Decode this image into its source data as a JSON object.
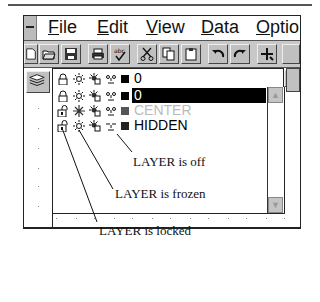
{
  "menu": {
    "items": [
      {
        "label": "File",
        "mnemonic": "F",
        "rest": "ile"
      },
      {
        "label": "Edit",
        "mnemonic": "E",
        "rest": "dit"
      },
      {
        "label": "View",
        "mnemonic": "V",
        "rest": "iew"
      },
      {
        "label": "Data",
        "mnemonic": "D",
        "rest": "ata"
      },
      {
        "label": "Options",
        "mnemonic": "O",
        "rest": "ptio"
      }
    ]
  },
  "toolbar": {
    "buttons": [
      "new-file",
      "open-file",
      "save",
      "print",
      "spell-check",
      "cut",
      "copy",
      "paste",
      "undo",
      "redo",
      "snap"
    ]
  },
  "layer_dropdown": {
    "current": {
      "name": "0",
      "color": "#000000",
      "locked": false,
      "frozen": false,
      "on": true
    }
  },
  "layers": [
    {
      "name": "0",
      "color": "#000000",
      "locked": false,
      "frozen": false,
      "on": true,
      "selected": true,
      "state": "normal"
    },
    {
      "name": "CENTER",
      "color": "#555555",
      "locked": true,
      "frozen": true,
      "on": true,
      "selected": false,
      "state": "frozen",
      "text_color": "#bbbbbb"
    },
    {
      "name": "HIDDEN",
      "color": "#222222",
      "locked": true,
      "frozen": false,
      "on": false,
      "selected": false,
      "state": "off",
      "text_color": "#111111"
    }
  ],
  "callouts": {
    "off": "LAYER is off",
    "frozen": "LAYER is frozen",
    "locked": "LAYER is locked"
  }
}
